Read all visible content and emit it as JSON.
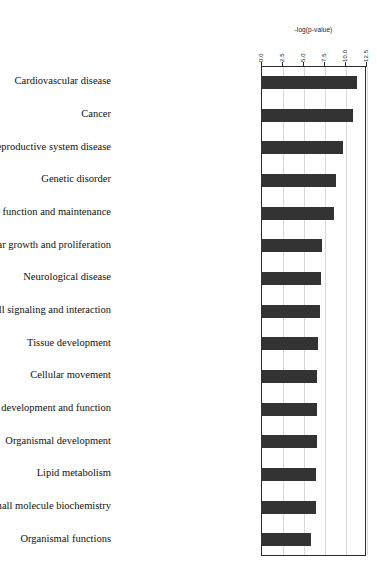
{
  "chart_data": {
    "type": "bar",
    "orientation": "horizontal",
    "title": "",
    "xlabel": "-log(p-value)",
    "ylabel": "",
    "xlim": [
      0.0,
      12.5
    ],
    "grid": true,
    "legend": false,
    "xticks": [
      "0.0",
      "2.5",
      "5.0",
      "7.5",
      "10.0",
      "12.5"
    ],
    "xtick_values": [
      0.0,
      2.5,
      5.0,
      7.5,
      10.0,
      12.5
    ],
    "bar_color": "#333333",
    "categories": [
      "Cardiovascular disease",
      "Cancer",
      "Reproductive system disease",
      "Genetic disorder",
      "Cellular function and maintenance",
      "Cellular growth and proliferation",
      "Neurological disease",
      "Cell-to-cell signaling and interaction",
      "Tissue development",
      "Cellular movement",
      "Cardiovascular system development and function",
      "Organismal development",
      "Lipid metabolism",
      "Small molecule biochemistry",
      "Organismal functions"
    ],
    "values": [
      11.4,
      11.0,
      9.8,
      8.9,
      8.7,
      7.3,
      7.1,
      7.0,
      6.8,
      6.7,
      6.7,
      6.7,
      6.6,
      6.5,
      5.9
    ]
  }
}
